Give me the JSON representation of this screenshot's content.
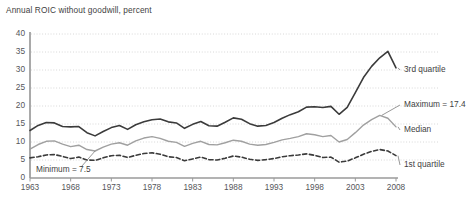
{
  "chart_data": {
    "type": "line",
    "title": "Annual ROIC without goodwill, percent",
    "xlabel": "",
    "ylabel": "",
    "ylim": [
      0,
      40
    ],
    "ytick_step": 5,
    "yticks": [
      "0",
      "5",
      "10",
      "15",
      "20",
      "25",
      "30",
      "35",
      "40"
    ],
    "xlim": [
      1963,
      2008
    ],
    "xticks": [
      "1963",
      "1968",
      "1973",
      "1978",
      "1983",
      "1988",
      "1993",
      "1998",
      "2003",
      "2008"
    ],
    "xtick_step": 5,
    "grid": "horizontal-dotted",
    "legend_position": "right-inline-labels",
    "x": [
      1963,
      1964,
      1965,
      1966,
      1967,
      1968,
      1969,
      1970,
      1971,
      1972,
      1973,
      1974,
      1975,
      1976,
      1977,
      1978,
      1979,
      1980,
      1981,
      1982,
      1983,
      1984,
      1985,
      1986,
      1987,
      1988,
      1989,
      1990,
      1991,
      1992,
      1993,
      1994,
      1995,
      1996,
      1997,
      1998,
      1999,
      2000,
      2001,
      2002,
      2003,
      2004,
      2005,
      2006,
      2007,
      2008
    ],
    "series": [
      {
        "name": "3rd quartile",
        "label": "3rd quartile",
        "color": "#3b3b3b",
        "style": "solid",
        "width": 1.6,
        "values": [
          13.2,
          14.6,
          15.4,
          15.3,
          14.3,
          14.2,
          14.3,
          12.6,
          11.7,
          12.9,
          14.0,
          14.6,
          13.5,
          14.8,
          15.6,
          16.2,
          16.4,
          15.6,
          15.3,
          13.8,
          14.9,
          15.7,
          14.5,
          14.4,
          15.5,
          16.7,
          16.3,
          15.1,
          14.4,
          14.6,
          15.4,
          16.6,
          17.6,
          18.4,
          19.7,
          19.8,
          19.6,
          19.9,
          17.7,
          19.6,
          23.7,
          27.9,
          31.0,
          33.4,
          35.2,
          30.6
        ]
      },
      {
        "name": "Median",
        "label": "Median",
        "color": "#a0a0a0",
        "style": "solid",
        "width": 1.4,
        "values": [
          8.0,
          9.3,
          10.2,
          10.3,
          9.4,
          8.7,
          9.1,
          7.9,
          7.5,
          8.6,
          9.4,
          9.8,
          9.1,
          10.3,
          11.1,
          11.5,
          11.0,
          10.2,
          9.9,
          8.8,
          9.6,
          10.2,
          9.3,
          9.2,
          9.8,
          10.5,
          10.2,
          9.4,
          9.1,
          9.3,
          9.9,
          10.6,
          11.0,
          11.5,
          12.3,
          12.0,
          11.5,
          11.8,
          10.0,
          10.7,
          12.6,
          14.7,
          16.2,
          17.4,
          16.6,
          14.2
        ]
      },
      {
        "name": "1st quartile",
        "label": "1st quartile",
        "color": "#3b3b3b",
        "style": "dashed",
        "width": 1.6,
        "values": [
          5.6,
          5.9,
          6.4,
          6.5,
          6.0,
          5.4,
          5.8,
          5.0,
          4.9,
          5.6,
          6.2,
          6.3,
          5.7,
          6.3,
          6.8,
          7.0,
          6.6,
          5.9,
          5.7,
          4.8,
          5.3,
          5.8,
          5.1,
          5.0,
          5.5,
          6.1,
          5.8,
          5.2,
          4.9,
          5.1,
          5.4,
          5.9,
          6.2,
          6.4,
          6.7,
          6.3,
          5.7,
          5.8,
          4.4,
          4.7,
          5.6,
          6.6,
          7.4,
          7.9,
          7.5,
          6.2
        ]
      }
    ],
    "annotations": [
      {
        "name": "minimum-annotation",
        "text": "Minimum = 7.5",
        "x": 1971,
        "y": 7.5
      }
    ],
    "inline_labels": [
      {
        "name": "label-3rd-quartile",
        "text": "3rd quartile"
      },
      {
        "name": "label-maximum",
        "text": "Maximum = 17.4"
      },
      {
        "name": "label-median",
        "text": "Median"
      },
      {
        "name": "label-1st-quartile",
        "text": "1st quartile"
      }
    ]
  }
}
